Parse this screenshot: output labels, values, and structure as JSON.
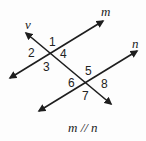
{
  "diagram": {
    "lines": [
      {
        "name": "m",
        "label": "m"
      },
      {
        "name": "v",
        "label": "v"
      },
      {
        "name": "n",
        "label": "n"
      }
    ],
    "angles": [
      "1",
      "2",
      "3",
      "4",
      "5",
      "6",
      "7",
      "8"
    ],
    "caption": "m // n",
    "colors": {
      "line": "#1e1e1e",
      "text": "#222222",
      "background": "#fdfdfd"
    }
  }
}
